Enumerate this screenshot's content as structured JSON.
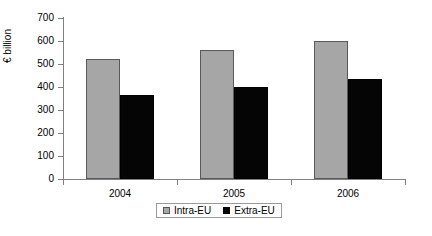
{
  "chart_data": {
    "type": "bar",
    "title": "",
    "subtitle": "",
    "xlabel": "",
    "ylabel": "€ billion",
    "categories": [
      "2004",
      "2005",
      "2006"
    ],
    "series": [
      {
        "name": "Intra-EU",
        "color": "#a6a6a6",
        "values": [
          520,
          560,
          600
        ]
      },
      {
        "name": "Extra-EU",
        "color": "#050505",
        "values": [
          365,
          400,
          435
        ]
      }
    ],
    "ylim": [
      0,
      700
    ],
    "ytick_values": [
      700,
      600,
      500,
      400,
      300,
      200,
      100,
      0
    ],
    "ytick_labels": [
      "700",
      "600",
      "500",
      "400",
      "300",
      "200",
      "100",
      "0"
    ],
    "grid": false,
    "legend_position": "bottom",
    "axis_color": "#808080"
  },
  "legend": {
    "entries": [
      {
        "label": "Intra-EU",
        "swatch": "gray-square-icon"
      },
      {
        "label": "Extra-EU",
        "swatch": "black-square-icon"
      }
    ]
  }
}
